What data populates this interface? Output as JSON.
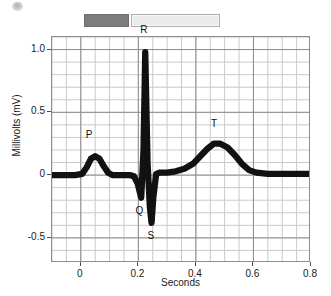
{
  "legend": {
    "solid_swatch_color": "#7c7c7c",
    "outline_swatch_color": "#ebebeb",
    "solid_label": "",
    "outline_label": ""
  },
  "chart_data": {
    "type": "line",
    "title": "",
    "xlabel": "Seconds",
    "ylabel": "Millivolts (mV)",
    "xlim": [
      -0.1,
      0.8
    ],
    "ylim": [
      -0.7,
      1.1
    ],
    "xticks": [
      0,
      0.2,
      0.4,
      0.6,
      0.8
    ],
    "xtick_labels": [
      "0",
      "0.2",
      "0.4",
      "0.6",
      "0.8"
    ],
    "yticks": [
      1.0,
      0.5,
      0,
      -0.5
    ],
    "ytick_labels": [
      "1.0",
      "0.5",
      "0",
      "-0.5"
    ],
    "grid": true,
    "grid_minor_step_x": 0.05,
    "grid_minor_step_y": 0.1,
    "grid_major_step_x": 0.2,
    "grid_major_step_y": 0.5,
    "legend_position": "top",
    "series": [
      {
        "name": "ECG trace",
        "color": "#111111",
        "line_width_mv": 0.05,
        "x": [
          -0.1,
          -0.06,
          -0.02,
          0.005,
          0.02,
          0.035,
          0.05,
          0.065,
          0.08,
          0.095,
          0.11,
          0.13,
          0.15,
          0.17,
          0.185,
          0.198,
          0.21,
          0.218,
          0.224,
          0.232,
          0.24,
          0.246,
          0.252,
          0.262,
          0.275,
          0.3,
          0.33,
          0.36,
          0.39,
          0.415,
          0.44,
          0.462,
          0.485,
          0.51,
          0.535,
          0.56,
          0.585,
          0.61,
          0.65,
          0.7,
          0.75,
          0.8
        ],
        "y": [
          0.0,
          0.0,
          0.0,
          0.01,
          0.06,
          0.13,
          0.15,
          0.13,
          0.07,
          0.02,
          0.0,
          0.0,
          0.0,
          0.0,
          -0.01,
          -0.07,
          -0.18,
          0.2,
          0.98,
          0.1,
          -0.25,
          -0.38,
          -0.18,
          0.01,
          0.02,
          0.02,
          0.03,
          0.05,
          0.09,
          0.15,
          0.21,
          0.25,
          0.25,
          0.22,
          0.16,
          0.09,
          0.04,
          0.02,
          0.01,
          0.01,
          0.01,
          0.01
        ]
      }
    ],
    "annotations": [
      {
        "label": "P",
        "x": 0.045,
        "y": 0.15,
        "dx": -4,
        "dy": -20
      },
      {
        "label": "Q",
        "x": 0.211,
        "y": -0.18,
        "dx": -2,
        "dy": 14
      },
      {
        "label": "R",
        "x": 0.224,
        "y": 0.98,
        "dx": -1,
        "dy": -21
      },
      {
        "label": "S",
        "x": 0.246,
        "y": -0.38,
        "dx": 0,
        "dy": 14
      },
      {
        "label": "T",
        "x": 0.47,
        "y": 0.25,
        "dx": -1,
        "dy": -19
      }
    ]
  }
}
